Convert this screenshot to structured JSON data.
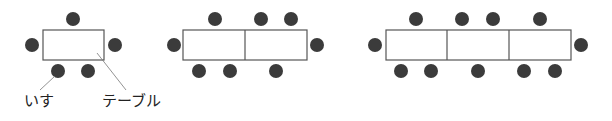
{
  "colors": {
    "chair": "#3b3b3b",
    "table_stroke": "#555555",
    "table_fill": "#ffffff",
    "leader_line": "#777777"
  },
  "labels": {
    "chair": "いす",
    "table": "テーブル"
  },
  "groups": [
    {
      "name": "one-table",
      "tables": 1,
      "chairs": 5,
      "rect": {
        "x": 43,
        "y": 30,
        "w": 61,
        "h": 30
      },
      "dividers": [],
      "chair_positions": [
        [
          73,
          19
        ],
        [
          32,
          45
        ],
        [
          115,
          45
        ],
        [
          58,
          71
        ],
        [
          88,
          71
        ]
      ]
    },
    {
      "name": "two-tables",
      "tables": 2,
      "chairs": 8,
      "rect": {
        "x": 183,
        "y": 30,
        "w": 124,
        "h": 30
      },
      "dividers": [
        245
      ],
      "chair_positions": [
        [
          215,
          19
        ],
        [
          261,
          19
        ],
        [
          291,
          19
        ],
        [
          174,
          45
        ],
        [
          317,
          45
        ],
        [
          199,
          71
        ],
        [
          230,
          71
        ],
        [
          276,
          71
        ]
      ]
    },
    {
      "name": "three-tables",
      "tables": 3,
      "chairs": 11,
      "rect": {
        "x": 386,
        "y": 30,
        "w": 185,
        "h": 30
      },
      "dividers": [
        447,
        509
      ],
      "chair_positions": [
        [
          416,
          19
        ],
        [
          462,
          19
        ],
        [
          493,
          19
        ],
        [
          540,
          19
        ],
        [
          375,
          45
        ],
        [
          581,
          45
        ],
        [
          401,
          71
        ],
        [
          431,
          71
        ],
        [
          478,
          71
        ],
        [
          524,
          71
        ],
        [
          555,
          71
        ]
      ]
    }
  ]
}
